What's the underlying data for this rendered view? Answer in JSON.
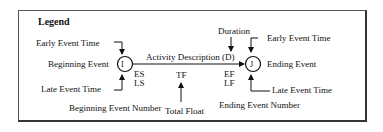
{
  "legend": {
    "title": "Legend",
    "begin": {
      "early_event_time": "Early  Event Time",
      "event_label": "Beginning Event",
      "late_event_time": "Late Event Time",
      "node_label": "I",
      "event_number": "Beginning Event Number"
    },
    "activity": {
      "description": "Activity Description",
      "es": "ES",
      "ls": "LS",
      "tf": "TF",
      "total_float": "Total Float",
      "duration": "Duration",
      "duration_symbol": "(D)",
      "ef": "EF",
      "lf": "LF"
    },
    "end": {
      "early_event_time": "Early  Event Time",
      "event_label": "Ending Event",
      "late_event_time": "Late Event Time",
      "node_label": "J",
      "event_number": "Ending Event Number"
    }
  }
}
